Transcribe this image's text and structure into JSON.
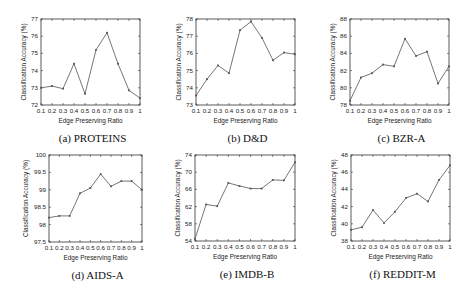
{
  "figure": {
    "xlabel": "Edge Preserving Ratio",
    "ylabel": "Classification Accuracy (%)",
    "line_color": "#666666",
    "frame_color": "#333333"
  },
  "chart_data": [
    {
      "type": "line",
      "caption": "(a) PROTEINS",
      "title": "PROTEINS",
      "xlabel": "Edge Preserving Ratio",
      "ylabel": "Classification Accuracy (%)",
      "x": [
        0.1,
        0.2,
        0.3,
        0.4,
        0.5,
        0.6,
        0.7,
        0.8,
        0.9,
        1
      ],
      "x_ticks": [
        "0.1",
        "0.2",
        "0.3",
        "0.4",
        "0.5",
        "0.6",
        "0.7",
        "0.8",
        "0.9",
        "1"
      ],
      "values": [
        73.0,
        73.1,
        72.95,
        74.4,
        72.65,
        75.2,
        76.2,
        74.4,
        72.85,
        72.4
      ],
      "ylim": [
        72,
        77
      ],
      "y_ticks": [
        "72",
        "73",
        "74",
        "75",
        "76",
        "77"
      ],
      "grid": false,
      "box": [
        41,
        19,
        140,
        105
      ]
    },
    {
      "type": "line",
      "caption": "(b) D&D",
      "title": "D&D",
      "xlabel": "Edge Preserving Ratio",
      "ylabel": "Classification Accuracy (%)",
      "x": [
        0.1,
        0.2,
        0.3,
        0.4,
        0.5,
        0.6,
        0.7,
        0.8,
        0.9,
        1
      ],
      "x_ticks": [
        "0.1",
        "0.2",
        "0.3",
        "0.4",
        "0.5",
        "0.6",
        "0.7",
        "0.8",
        "0.9",
        "1"
      ],
      "values": [
        73.55,
        74.5,
        75.3,
        74.85,
        77.35,
        77.85,
        76.9,
        75.6,
        76.05,
        75.95
      ],
      "ylim": [
        73,
        78
      ],
      "y_ticks": [
        "73",
        "74",
        "75",
        "76",
        "77",
        "78"
      ],
      "grid": false,
      "box": [
        196,
        19,
        295,
        105
      ]
    },
    {
      "type": "line",
      "caption": "(c) BZR-A",
      "title": "BZR-A",
      "xlabel": "Edge Preserving Ratio",
      "ylabel": "Classification Accuracy (%)",
      "x": [
        0.1,
        0.2,
        0.3,
        0.4,
        0.5,
        0.6,
        0.7,
        0.8,
        0.9,
        1
      ],
      "x_ticks": [
        "0.1",
        "0.2",
        "0.3",
        "0.4",
        "0.5",
        "0.6",
        "0.7",
        "0.8",
        "0.9",
        "1"
      ],
      "values": [
        78.5,
        81.2,
        81.7,
        82.7,
        82.5,
        85.7,
        83.7,
        84.2,
        80.5,
        82.5
      ],
      "ylim": [
        78,
        88
      ],
      "y_ticks": [
        "78",
        "80",
        "82",
        "84",
        "86",
        "88"
      ],
      "grid": false,
      "box": [
        350,
        19,
        449,
        105
      ]
    },
    {
      "type": "line",
      "caption": "(d) AIDS-A",
      "title": "AIDS-A",
      "xlabel": "Edge Preserving Ratio",
      "ylabel": "Classification Accuracy (%)",
      "x": [
        0.1,
        0.2,
        0.3,
        0.4,
        0.5,
        0.6,
        0.7,
        0.8,
        0.9,
        1
      ],
      "x_ticks": [
        "0.1",
        "0.2",
        "0.3",
        "0.4",
        "0.5",
        "0.6",
        "0.7",
        "0.8",
        "0.9",
        "1"
      ],
      "values": [
        98.2,
        98.25,
        98.25,
        98.9,
        99.05,
        99.45,
        99.1,
        99.25,
        99.25,
        99.0
      ],
      "ylim": [
        97.5,
        100
      ],
      "y_ticks": [
        "97.5",
        "98",
        "98.5",
        "99",
        "99.5",
        "100"
      ],
      "grid": false,
      "box": [
        49,
        155,
        142,
        242
      ]
    },
    {
      "type": "line",
      "caption": "(e) IMDB-B",
      "title": "IMDB-B",
      "xlabel": "Edge Preserving Ratio",
      "ylabel": "Classification Accuracy (%)",
      "x": [
        0.1,
        0.2,
        0.3,
        0.4,
        0.5,
        0.6,
        0.7,
        0.8,
        0.9,
        1
      ],
      "x_ticks": [
        "0.1",
        "0.2",
        "0.3",
        "0.4",
        "0.5",
        "0.6",
        "0.7",
        "0.8",
        "0.9",
        "1"
      ],
      "values": [
        54.5,
        62.5,
        62.1,
        67.5,
        66.8,
        66.2,
        66.2,
        68.2,
        68.1,
        72.3
      ],
      "ylim": [
        54,
        74
      ],
      "y_ticks": [
        "54",
        "58",
        "62",
        "66",
        "70",
        "74"
      ],
      "grid": false,
      "box": [
        195,
        155,
        295,
        241
      ]
    },
    {
      "type": "line",
      "caption": "(f) REDDIT-M",
      "title": "REDDIT-M",
      "xlabel": "Edge Preserving Ratio",
      "ylabel": "Classification Accuracy (%)",
      "x": [
        0.1,
        0.2,
        0.3,
        0.4,
        0.5,
        0.6,
        0.7,
        0.8,
        0.9,
        1
      ],
      "x_ticks": [
        "0.1",
        "0.2",
        "0.3",
        "0.4",
        "0.5",
        "0.6",
        "0.7",
        "0.8",
        "0.9",
        "1"
      ],
      "values": [
        39.3,
        39.6,
        41.6,
        40.1,
        41.4,
        43.0,
        43.5,
        42.6,
        45.1,
        46.8
      ],
      "ylim": [
        38,
        48
      ],
      "y_ticks": [
        "38",
        "40",
        "42",
        "44",
        "46",
        "48"
      ],
      "grid": false,
      "box": [
        351,
        155,
        450,
        241
      ]
    }
  ]
}
